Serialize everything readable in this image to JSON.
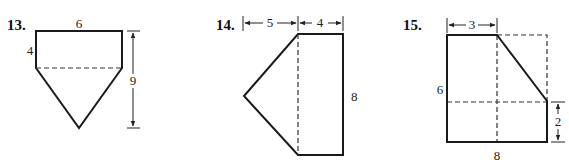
{
  "figures": [
    {
      "number": "13.",
      "labels": {
        "top": "6",
        "left": "4",
        "height": "9"
      },
      "description": "Rectangle 6 by 4 on top of an isosceles triangle; total height 9"
    },
    {
      "number": "14.",
      "labels": {
        "left_width": "5",
        "right_width": "4",
        "height": "8"
      },
      "description": "Triangle with base 8 and height 5 attached to a 4 by 8 rectangle"
    },
    {
      "number": "15.",
      "labels": {
        "top": "3",
        "left": "6",
        "bottom": "8",
        "right": "2"
      },
      "description": "8 by 6 rectangle with a corner triangle cut off; top edge 3, right edge 2"
    }
  ]
}
